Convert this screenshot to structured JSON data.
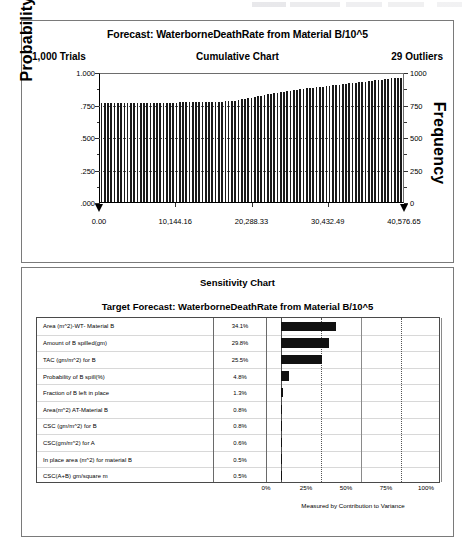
{
  "forecast": {
    "title": "Forecast: WaterborneDeathRate from Material B/10^5",
    "trials": "1,000 Trials",
    "chart_type_label": "Cumulative Chart",
    "outliers": "29 Outliers",
    "ylabel_left": "Probability",
    "ylabel_right": "Frequency",
    "y_ticks_left": [
      "1.000",
      ".750",
      ".500",
      ".250",
      ".000"
    ],
    "y_ticks_right": [
      "1000",
      "750",
      "500",
      "250",
      "0"
    ],
    "x_ticks": [
      "0.00",
      "10,144.16",
      "20,288.33",
      "30,432.49",
      "40,576.65"
    ]
  },
  "sensitivity": {
    "title": "Sensitivity Chart",
    "subtitle": "Target Forecast:  WaterborneDeathRate from Material B/10^5",
    "x_ticks": [
      "0%",
      "25%",
      "50%",
      "75%",
      "100%"
    ],
    "footer": "Measured by Contribution to Variance",
    "rows": [
      {
        "name": "Area (m^2)-WT- Material B",
        "pct": "34.1%"
      },
      {
        "name": "Amount of B spilled(gm)",
        "pct": "29.8%"
      },
      {
        "name": "TAC (gm/m^2) for B",
        "pct": "25.5%"
      },
      {
        "name": "Probability of B spill(%)",
        "pct": "4.8%"
      },
      {
        "name": "Fraction of B left in place",
        "pct": "1.3%"
      },
      {
        "name": "Area(m^2) AT-Material B",
        "pct": "0.8%"
      },
      {
        "name": "CSC (gm/m^2) for B",
        "pct": "0.8%"
      },
      {
        "name": "CSC(gm/m^2) for A",
        "pct": "0.6%"
      },
      {
        "name": "In place area (m^2) for material B",
        "pct": "0.5%"
      },
      {
        "name": "CSC(A+B) gm/square m",
        "pct": "0.5%"
      }
    ]
  },
  "chart_data": [
    {
      "type": "bar",
      "title": "Forecast: WaterborneDeathRate from Material B/10^5",
      "subtitle": "Cumulative Chart",
      "xlabel": "",
      "ylabel": "Probability",
      "ylabel_secondary": "Frequency",
      "xlim": [
        0.0,
        40576.65
      ],
      "ylim": [
        0.0,
        1.0
      ],
      "ylim_secondary": [
        0,
        1000
      ],
      "xticks": [
        0.0,
        10144.16,
        20288.33,
        30432.49,
        40576.65
      ],
      "xticklabels": [
        "0.00",
        "10,144.16",
        "20,288.33",
        "30,432.49",
        "40,576.65"
      ],
      "yticks": [
        0.0,
        0.25,
        0.5,
        0.75,
        1.0
      ],
      "yticklabels": [
        ".000",
        ".250",
        ".500",
        ".750",
        "1.000"
      ],
      "yticks_secondary": [
        0,
        250,
        500,
        750,
        1000
      ],
      "yticklabels_secondary": [
        "0",
        "250",
        "500",
        "750",
        "1000"
      ],
      "grid": true,
      "trials": 1000,
      "outliers": 29,
      "values": [
        0.77,
        0.77,
        0.77,
        0.771,
        0.771,
        0.771,
        0.772,
        0.772,
        0.772,
        0.773,
        0.773,
        0.773,
        0.774,
        0.774,
        0.774,
        0.775,
        0.775,
        0.775,
        0.776,
        0.776,
        0.776,
        0.777,
        0.777,
        0.777,
        0.778,
        0.778,
        0.778,
        0.779,
        0.779,
        0.78,
        0.78,
        0.781,
        0.781,
        0.782,
        0.782,
        0.783,
        0.784,
        0.785,
        0.786,
        0.788,
        0.79,
        0.793,
        0.797,
        0.801,
        0.806,
        0.811,
        0.816,
        0.821,
        0.826,
        0.831,
        0.836,
        0.841,
        0.845,
        0.849,
        0.853,
        0.857,
        0.861,
        0.865,
        0.869,
        0.873,
        0.877,
        0.88,
        0.884,
        0.887,
        0.89,
        0.893,
        0.896,
        0.899,
        0.902,
        0.905,
        0.908,
        0.911,
        0.914,
        0.917,
        0.92,
        0.923,
        0.926,
        0.929,
        0.932,
        0.935,
        0.938,
        0.941,
        0.944,
        0.947,
        0.95,
        0.953,
        0.956,
        0.959,
        0.962,
        0.965,
        0.968,
        0.97,
        0.971
      ]
    },
    {
      "type": "bar",
      "orientation": "horizontal",
      "title": "Sensitivity Chart",
      "subtitle": "Target Forecast:  WaterborneDeathRate from Material B/10^5",
      "xlabel": "Measured by Contribution to Variance",
      "ylabel": "",
      "xlim": [
        0,
        100
      ],
      "xticks": [
        0,
        25,
        50,
        75,
        100
      ],
      "xticklabels": [
        "0%",
        "25%",
        "50%",
        "75%",
        "100%"
      ],
      "grid": true,
      "categories": [
        "Area (m^2)-WT- Material B",
        "Amount of B spilled(gm)",
        "TAC (gm/m^2) for B",
        "Probability of B spill(%)",
        "Fraction of B left in place",
        "Area(m^2) AT-Material B",
        "CSC (gm/m^2) for B",
        "CSC(gm/m^2) for A",
        "In place area (m^2) for material B",
        "CSC(A+B) gm/square m"
      ],
      "values": [
        34.1,
        29.8,
        25.5,
        4.8,
        1.3,
        0.8,
        0.8,
        0.6,
        0.5,
        0.5
      ]
    }
  ]
}
